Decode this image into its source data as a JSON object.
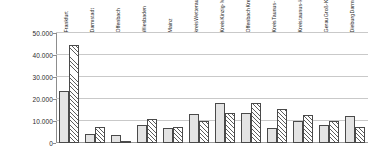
{
  "chart_data": {
    "type": "bar",
    "title": "",
    "subtitle": "",
    "xlabel": "",
    "ylabel": "",
    "ylim": [
      0,
      50000
    ],
    "grid": true,
    "legend_position": "none",
    "y_ticks": [
      0,
      10000,
      20000,
      30000,
      40000,
      50000
    ],
    "y_tick_labels": [
      "0",
      "10.000",
      "20.000",
      "30.000",
      "40.000",
      "50.000"
    ],
    "number_format": "german-thousands-dot",
    "categories": [
      "Frankfurt",
      "Darmstadt",
      "Offenbach",
      "Wiesbaden",
      "Mainz",
      "Wetterau-kreis",
      "Main-Kinzig-Kreis",
      "Kreis Offenbach",
      "Main-Taunus-Kreis",
      "Hoch-taunus-Kreis",
      "Kreis Groß-Gerau",
      "Kreis Darmstadt-Dieburg"
    ],
    "category_label_lines": [
      [
        "Frankfurt"
      ],
      [
        "Darmstadt"
      ],
      [
        "Offenbach"
      ],
      [
        "Wiesbaden"
      ],
      [
        "Mainz"
      ],
      [
        "Wetterau-",
        "kreis"
      ],
      [
        "Main-",
        "Kinzig-",
        "Kreis"
      ],
      [
        "Kreis",
        "Offenbach"
      ],
      [
        "Main-",
        "Taunus-",
        "Kreis"
      ],
      [
        "Hoch-",
        "taunus-",
        "Kreis"
      ],
      [
        "Kreis",
        "Groß-",
        "Gerau"
      ],
      [
        "Kreis",
        "Darmstadt-",
        "Dieburg"
      ]
    ],
    "series": [
      {
        "name": "series-1",
        "pattern": "dotted",
        "values": [
          23700,
          4300,
          3800,
          8000,
          6800,
          13300,
          18200,
          13800,
          6700,
          10200,
          8400,
          12200
        ]
      },
      {
        "name": "series-2",
        "pattern": "hatched",
        "values": [
          44500,
          7200,
          600,
          11000,
          7500,
          10000,
          13500,
          18300,
          15500,
          12600,
          9900,
          7300
        ]
      }
    ]
  },
  "colors": {
    "gridline": "#c9c9c9",
    "axis": "#8d8d8d",
    "bar_outline": "#4a4a4a",
    "series1_fill": "#e4e4e4",
    "series2_fill": "#ffffff",
    "text": "#1f1f1f",
    "background": "#ffffff"
  }
}
